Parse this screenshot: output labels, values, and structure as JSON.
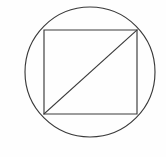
{
  "figure": {
    "canvas": {
      "width": 166,
      "height": 157,
      "background_color": "#fefefe"
    },
    "style": {
      "stroke_color": "#3a3a3a",
      "stroke_width": 1.15,
      "fill": "none"
    },
    "shapes": {
      "circle": {
        "name": "circle",
        "center_x": 90,
        "center_y": 72,
        "radius": 65,
        "bounds": {
          "left": 25,
          "right": 155,
          "top": 7,
          "bottom": 137
        }
      },
      "rectangle": {
        "name": "rectangle",
        "x": 44,
        "y": 30,
        "width": 93,
        "height": 84,
        "corners": {
          "top_left": {
            "x": 44,
            "y": 30
          },
          "top_right": {
            "x": 137,
            "y": 30
          },
          "bottom_right": {
            "x": 137,
            "y": 114
          },
          "bottom_left": {
            "x": 44,
            "y": 114
          }
        }
      },
      "diagonal": {
        "name": "diagonal-line",
        "x1": 44,
        "y1": 114,
        "x2": 137,
        "y2": 30,
        "direction": "bottom-left to top-right"
      }
    }
  }
}
